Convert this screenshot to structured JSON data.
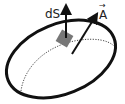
{
  "diagram": {
    "labels": {
      "area_element": "dS",
      "vector": "A",
      "vector_arrow": "→"
    },
    "colors": {
      "outline": "#111111",
      "patch": "#777777",
      "dotted_curve": "#333333",
      "arrows": "#111111",
      "text": "#222222"
    },
    "elements": [
      {
        "id": "surface-boundary",
        "kind": "ellipse",
        "style": "solid-thick"
      },
      {
        "id": "hidden-curve",
        "kind": "curve",
        "style": "dotted"
      },
      {
        "id": "area-patch",
        "kind": "square",
        "style": "filled-gray"
      },
      {
        "id": "normal-arrow",
        "kind": "arrow",
        "label": "dS",
        "direction": "up"
      },
      {
        "id": "vector-arrow",
        "kind": "arrow",
        "label": "A",
        "direction": "up-right"
      }
    ]
  }
}
